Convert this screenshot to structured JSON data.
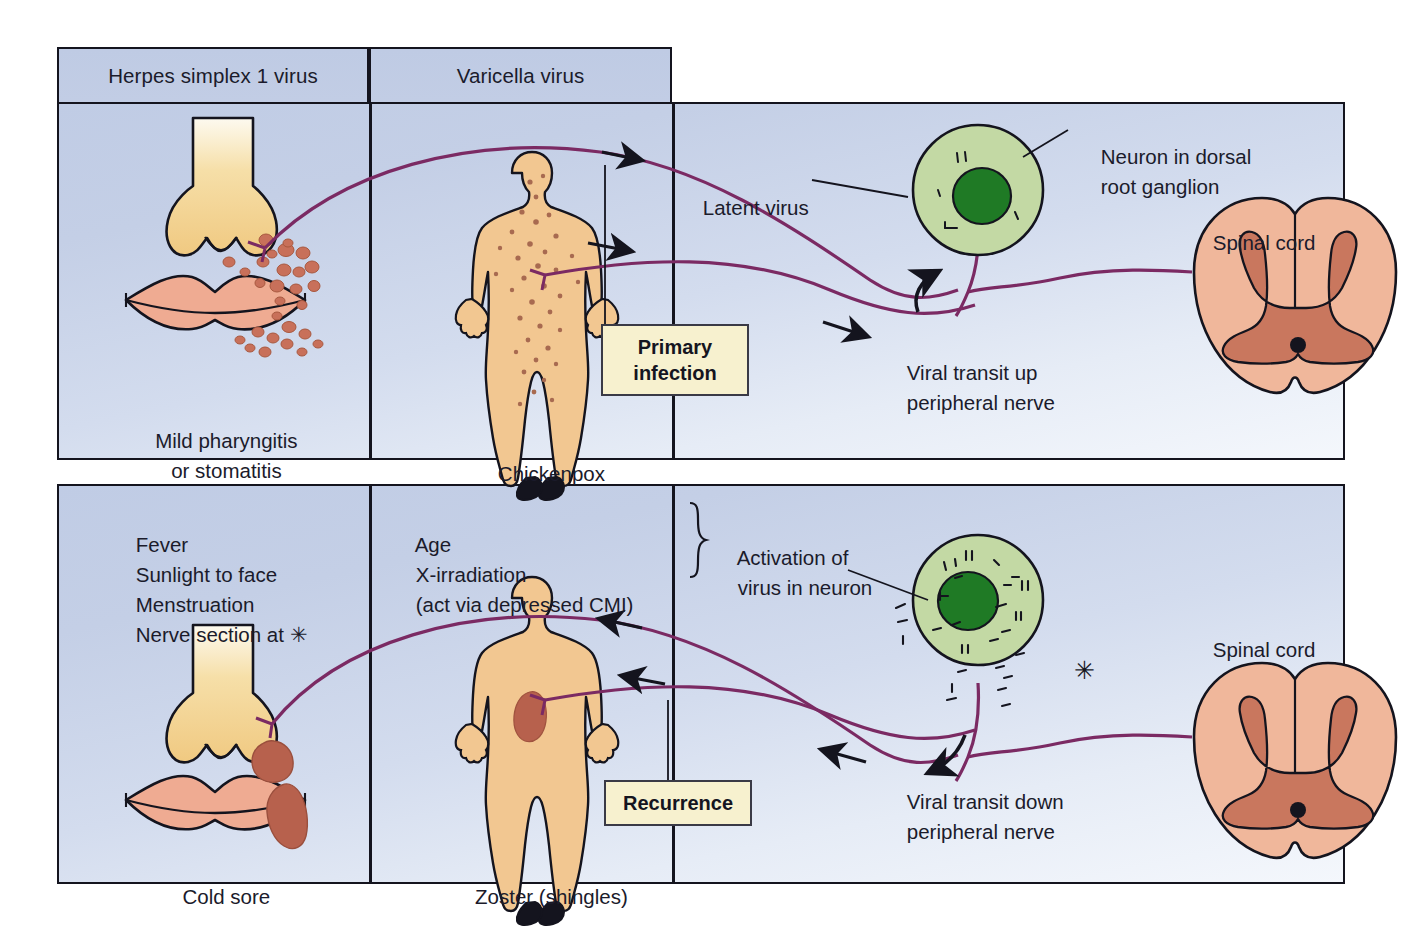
{
  "figure": {
    "type": "diagram",
    "background_color": "#c6d1e7",
    "border_color": "#14141e"
  },
  "panels": [
    {
      "id": "primary",
      "headers": [
        {
          "label": "Herpes simplex 1 virus"
        },
        {
          "label": "Varicella virus"
        }
      ],
      "callout": {
        "line1": "Primary",
        "line2": "infection",
        "color": "#f7f1cf"
      },
      "labels": {
        "left_caption_line1": "Mild pharyngitis",
        "left_caption_line2": "or stomatitis",
        "mid_caption": "Chickenpox",
        "latent_virus": "Latent virus",
        "neuron_label_line1": "Neuron in dorsal",
        "neuron_label_line2": "root ganglion",
        "spinal_cord": "Spinal cord",
        "transit_line1": "Viral transit up",
        "transit_line2": "peripheral nerve"
      }
    },
    {
      "id": "recurrence",
      "callout": {
        "line1": "Recurrence",
        "line2": "",
        "color": "#f7f1cf"
      },
      "trigger_list_left": [
        "Fever",
        "Sunlight to face",
        "Menstruation",
        "Nerve section at ✳"
      ],
      "trigger_list_mid": [
        "Age",
        "X-irradiation",
        "(act via depressed CMI)"
      ],
      "labels": {
        "activation_line1": "Activation of",
        "activation_line2": "virus in neuron",
        "left_caption": "Cold sore",
        "mid_caption": "Zoster (shingles)",
        "spinal_cord": "Spinal cord",
        "transit_line1": "Viral transit down",
        "transit_line2": "peripheral nerve",
        "nerve_section_marker": "✳"
      }
    }
  ],
  "colors": {
    "nerve": "#7b2a63",
    "neuron_cytoplasm": "#c3d9a4",
    "neuron_nucleus": "#1f7a25",
    "skin": "#f2c791",
    "nose": "#f2d08d",
    "lips": "#efab92",
    "vesicle": "#c8705a",
    "cold_sore": "#b7614d",
    "cord_white": "#f0b79b",
    "cord_gray": "#c9775e",
    "outline": "#14141e"
  },
  "icons": {
    "arrow": "arrow-icon",
    "brace": "curly-brace-icon",
    "asterisk": "asterisk-icon"
  }
}
